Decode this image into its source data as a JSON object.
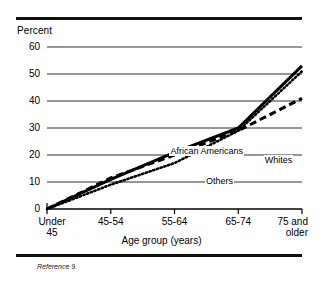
{
  "figure": {
    "y_axis_title": "Percent",
    "x_axis_title": "Age group (years)",
    "reference_note": "Reference 9."
  },
  "labels": {
    "african_americans": "African Americans",
    "whites": "Whites",
    "others": "Others"
  },
  "chart_data": {
    "type": "line",
    "title": "",
    "subtitle": "",
    "xlabel": "Age group (years)",
    "ylabel": "Percent",
    "categories": [
      "Under\n45",
      "45-54",
      "55-64",
      "65-74",
      "75 and\nolder"
    ],
    "category_labels": [
      "Under 45",
      "45-54",
      "55-64",
      "65-74",
      "75 and older"
    ],
    "yticks": [
      0,
      10,
      20,
      30,
      40,
      50,
      60
    ],
    "ylim": [
      0,
      60
    ],
    "grid": "horizontal",
    "legend": "inline-annotations",
    "series": [
      {
        "name": "African Americans",
        "style": "solid",
        "values": [
          0,
          11,
          21,
          30,
          53
        ]
      },
      {
        "name": "Whites",
        "style": "dashed",
        "values": [
          0,
          11.5,
          20,
          29,
          41
        ]
      },
      {
        "name": "Others",
        "style": "dotted",
        "values": [
          0,
          9,
          17,
          29,
          51
        ]
      }
    ],
    "annotations": [
      {
        "text": "African Americans",
        "x_pct": 48,
        "y_pct": 36
      },
      {
        "text": "Whites",
        "x_pct": 85,
        "y_pct": 30
      },
      {
        "text": "Others",
        "x_pct": 62,
        "y_pct": 17
      }
    ]
  }
}
